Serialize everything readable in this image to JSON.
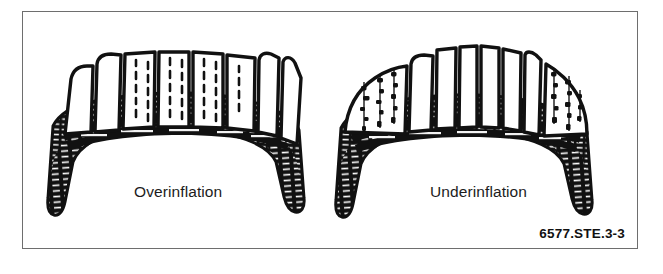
{
  "figure": {
    "id_label": "6577.STE.3-3",
    "border_color": "#6e6e6e",
    "background_color": "#ffffff",
    "ink_color": "#111111"
  },
  "diagrams": [
    {
      "name": "overinflation",
      "label": "Overinflation",
      "description": "Cross-section of a tire with center tread ribs standing proud and rounded, worn shoulders rounded away",
      "wear_pattern": "center"
    },
    {
      "name": "underinflation",
      "label": "Underinflation",
      "description": "Cross-section of a tire with tall center ribs and worn, flattened outer shoulders",
      "wear_pattern": "shoulders"
    }
  ]
}
